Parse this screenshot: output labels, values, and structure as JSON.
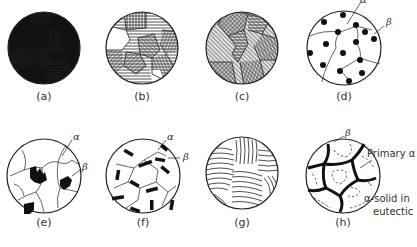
{
  "figure": {
    "panels": [
      {
        "id": "a",
        "caption": "(a)",
        "description": "two-phase grains: solid black and hatched"
      },
      {
        "id": "b",
        "caption": "(b)",
        "description": "hatched grains with white regions"
      },
      {
        "id": "c",
        "caption": "(c)",
        "description": "single-phase polycrystal, hatched grains"
      },
      {
        "id": "d",
        "caption": "(d)",
        "description": "beta particles at grain boundaries and within alpha",
        "labels": {
          "alpha": "α",
          "beta": "β"
        }
      },
      {
        "id": "e",
        "caption": "(e)",
        "description": "irregular beta precipitates in alpha grains",
        "labels": {
          "alpha": "α",
          "beta": "β"
        }
      },
      {
        "id": "f",
        "caption": "(f)",
        "description": "rod-shaped beta in alpha grains",
        "labels": {
          "alpha": "α",
          "beta": "β"
        }
      },
      {
        "id": "g",
        "caption": "(g)",
        "description": "lamellar eutectic colonies"
      },
      {
        "id": "h",
        "caption": "(h)",
        "description": "primary alpha with eutectic at boundaries",
        "labels": {
          "beta": "β",
          "primary_alpha": "Primary α",
          "alpha_eutectic_line1": "α-solid in",
          "alpha_eutectic_line2": "eutectic"
        }
      }
    ]
  }
}
